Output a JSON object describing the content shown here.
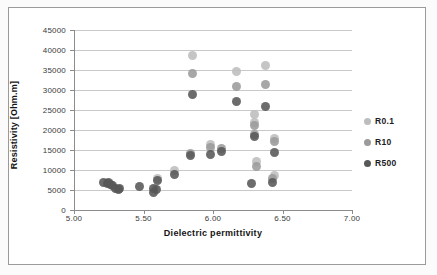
{
  "chart_data": {
    "type": "scatter",
    "title": "",
    "xlabel": "Dielectric permittivity",
    "ylabel": "Resistivity [Ohm.m]",
    "xlim": [
      5.0,
      7.0
    ],
    "ylim": [
      0,
      45000
    ],
    "xticks": [
      "5.00",
      "5.50",
      "6.00",
      "6.50",
      "7.00"
    ],
    "xtick_values": [
      5.0,
      5.5,
      6.0,
      6.5,
      7.0
    ],
    "yticks": [
      "0",
      "5000",
      "10000",
      "15000",
      "20000",
      "25000",
      "30000",
      "35000",
      "40000",
      "45000"
    ],
    "ytick_values": [
      0,
      5000,
      10000,
      15000,
      20000,
      25000,
      30000,
      35000,
      40000,
      45000
    ],
    "grid": "horizontal",
    "legend_position": "right",
    "colors": {
      "R0.1": "#bdbdbd",
      "R10": "#9b9b9b",
      "R500": "#585858"
    },
    "series": [
      {
        "name": "R0.1",
        "color": "#bdbdbd",
        "points": [
          [
            5.85,
            38700
          ],
          [
            6.17,
            34600
          ],
          [
            6.38,
            36100
          ],
          [
            5.98,
            16300
          ],
          [
            6.3,
            23900
          ],
          [
            6.3,
            21800
          ],
          [
            6.31,
            12200
          ],
          [
            6.44,
            18000
          ],
          [
            6.44,
            8600
          ],
          [
            5.6,
            7800
          ],
          [
            5.72,
            9900
          ]
        ]
      },
      {
        "name": "R10",
        "color": "#9b9b9b",
        "points": [
          [
            5.85,
            34200
          ],
          [
            6.17,
            31000
          ],
          [
            6.38,
            31300
          ],
          [
            6.3,
            21200
          ],
          [
            6.3,
            19000
          ],
          [
            6.31,
            10800
          ],
          [
            6.44,
            17200
          ],
          [
            6.43,
            7900
          ],
          [
            5.98,
            15700
          ],
          [
            5.84,
            14200
          ],
          [
            6.06,
            15300
          ]
        ]
      },
      {
        "name": "R500",
        "color": "#585858",
        "points": [
          [
            5.85,
            28900
          ],
          [
            6.17,
            27200
          ],
          [
            6.38,
            25800
          ],
          [
            6.3,
            18500
          ],
          [
            6.44,
            14400
          ],
          [
            6.28,
            6700
          ],
          [
            6.43,
            6900
          ],
          [
            5.98,
            13800
          ],
          [
            5.84,
            13700
          ],
          [
            6.06,
            14600
          ],
          [
            5.72,
            9000
          ],
          [
            5.6,
            7500
          ],
          [
            5.57,
            5400
          ],
          [
            5.57,
            4400
          ],
          [
            5.59,
            5200
          ],
          [
            5.47,
            5800
          ],
          [
            5.21,
            6900
          ],
          [
            5.24,
            6600
          ],
          [
            5.26,
            6300
          ],
          [
            5.28,
            6100
          ],
          [
            5.3,
            5500
          ],
          [
            5.32,
            5100
          ],
          [
            5.33,
            5300
          ],
          [
            5.25,
            6800
          ]
        ]
      }
    ]
  },
  "legend": {
    "items": [
      {
        "label": "R0.1",
        "color": "#bdbdbd"
      },
      {
        "label": "R10",
        "color": "#9b9b9b"
      },
      {
        "label": "R500",
        "color": "#585858"
      }
    ]
  }
}
